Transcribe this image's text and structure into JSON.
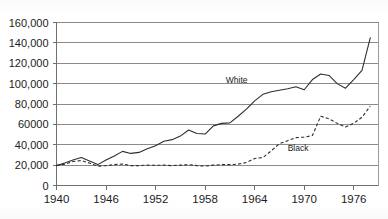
{
  "chart_data": {
    "type": "line",
    "title": "",
    "subtitle": "",
    "xlabel": "",
    "ylabel": "",
    "xlim": [
      1940,
      1979
    ],
    "ylim": [
      0,
      160000
    ],
    "grid": true,
    "grid_axis": "y",
    "legend_position": "inline-annotation",
    "y_ticks": [
      {
        "value": 160000,
        "label": "160,000"
      },
      {
        "value": 140000,
        "label": "140,000"
      },
      {
        "value": 120000,
        "label": "120,000"
      },
      {
        "value": 100000,
        "label": "100,000"
      },
      {
        "value": 80000,
        "label": "80,000"
      },
      {
        "value": 60000,
        "label": "60000"
      },
      {
        "value": 40000,
        "label": "40,000"
      },
      {
        "value": 20000,
        "label": "20,000"
      },
      {
        "value": 0,
        "label": "0"
      }
    ],
    "x_ticks": [
      {
        "value": 1940,
        "label": "1940"
      },
      {
        "value": 1946,
        "label": "1946"
      },
      {
        "value": 1952,
        "label": "1952"
      },
      {
        "value": 1958,
        "label": "1958"
      },
      {
        "value": 1964,
        "label": "1964"
      },
      {
        "value": 1970,
        "label": "1970"
      },
      {
        "value": 1976,
        "label": "1976"
      }
    ],
    "x": [
      1940,
      1941,
      1942,
      1943,
      1944,
      1945,
      1946,
      1947,
      1948,
      1949,
      1950,
      1951,
      1952,
      1953,
      1954,
      1955,
      1956,
      1957,
      1958,
      1959,
      1960,
      1961,
      1962,
      1963,
      1964,
      1965,
      1966,
      1967,
      1968,
      1969,
      1970,
      1971,
      1972,
      1973,
      1974,
      1975,
      1976,
      1977,
      1978
    ],
    "series": [
      {
        "name": "White",
        "style": "solid",
        "color": "#2e2e2e",
        "label": "White",
        "values": [
          19500,
          22000,
          25000,
          27500,
          24000,
          20500,
          25000,
          29000,
          33500,
          31500,
          32500,
          36000,
          39000,
          43500,
          45000,
          48500,
          54500,
          51000,
          50500,
          58500,
          61000,
          61500,
          68000,
          75000,
          83000,
          89500,
          92000,
          93500,
          95000,
          97000,
          94000,
          104000,
          109500,
          108000,
          100000,
          95500,
          104000,
          113000,
          145000
        ]
      },
      {
        "name": "Black",
        "style": "dashed",
        "color": "#2e2e2e",
        "label": "Black",
        "values": [
          19500,
          21000,
          23500,
          24500,
          22000,
          19000,
          19500,
          20500,
          21000,
          19500,
          19500,
          20000,
          19800,
          20000,
          19500,
          20000,
          20500,
          19500,
          19000,
          20000,
          20500,
          20500,
          21000,
          22500,
          26500,
          27500,
          34000,
          41000,
          44000,
          47000,
          47500,
          49000,
          68000,
          65500,
          61000,
          57500,
          61000,
          67000,
          78000
        ]
      }
    ],
    "annotations": [
      {
        "text": "White",
        "x": 1960.5,
        "y": 101000
      },
      {
        "text": "Black",
        "x": 1968.0,
        "y": 34000
      }
    ]
  }
}
